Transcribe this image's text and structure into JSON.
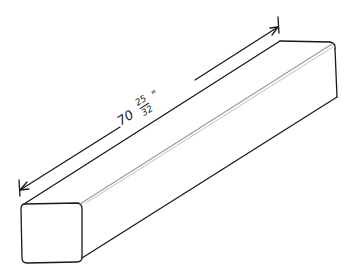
{
  "figure": {
    "dimension": {
      "whole": "70",
      "fraction_numerator": "25",
      "fraction_denominator": "32",
      "unit_mark": "\""
    },
    "colors": {
      "ink": "#1a1a1a",
      "background": "#ffffff",
      "highlight": "#9a9a9a"
    }
  }
}
